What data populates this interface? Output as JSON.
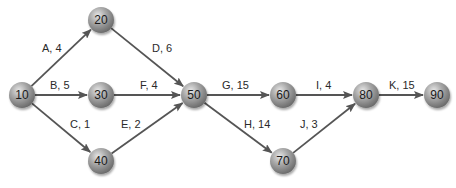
{
  "diagram": {
    "type": "network",
    "colors": {
      "node_fill": "#8a8a8a",
      "node_highlight": "#d8d8d8",
      "edge": "#555555",
      "text": "#222222"
    },
    "nodes": [
      {
        "id": "10",
        "label": "10",
        "x": 22,
        "y": 95
      },
      {
        "id": "20",
        "label": "20",
        "x": 101,
        "y": 20
      },
      {
        "id": "30",
        "label": "30",
        "x": 101,
        "y": 95
      },
      {
        "id": "40",
        "label": "40",
        "x": 101,
        "y": 161
      },
      {
        "id": "50",
        "label": "50",
        "x": 194,
        "y": 95
      },
      {
        "id": "60",
        "label": "60",
        "x": 283,
        "y": 95
      },
      {
        "id": "70",
        "label": "70",
        "x": 283,
        "y": 161
      },
      {
        "id": "80",
        "label": "80",
        "x": 366,
        "y": 95
      },
      {
        "id": "90",
        "label": "90",
        "x": 437,
        "y": 95
      }
    ],
    "edges": [
      {
        "from": "10",
        "to": "20",
        "label": "A, 4",
        "lx": 42,
        "ly": 52
      },
      {
        "from": "10",
        "to": "30",
        "label": "B, 5",
        "lx": 50,
        "ly": 89
      },
      {
        "from": "10",
        "to": "40",
        "label": "C, 1",
        "lx": 70,
        "ly": 128
      },
      {
        "from": "20",
        "to": "50",
        "label": "D, 6",
        "lx": 152,
        "ly": 52
      },
      {
        "from": "30",
        "to": "50",
        "label": "F, 4",
        "lx": 140,
        "ly": 89
      },
      {
        "from": "40",
        "to": "50",
        "label": "E, 2",
        "lx": 121,
        "ly": 128
      },
      {
        "from": "50",
        "to": "60",
        "label": "G, 15",
        "lx": 222,
        "ly": 89
      },
      {
        "from": "50",
        "to": "70",
        "label": "H, 14",
        "lx": 244,
        "ly": 128
      },
      {
        "from": "60",
        "to": "80",
        "label": "I, 4",
        "lx": 316,
        "ly": 89
      },
      {
        "from": "70",
        "to": "80",
        "label": "J, 3",
        "lx": 300,
        "ly": 128
      },
      {
        "from": "80",
        "to": "90",
        "label": "K, 15",
        "lx": 389,
        "ly": 89
      }
    ]
  }
}
